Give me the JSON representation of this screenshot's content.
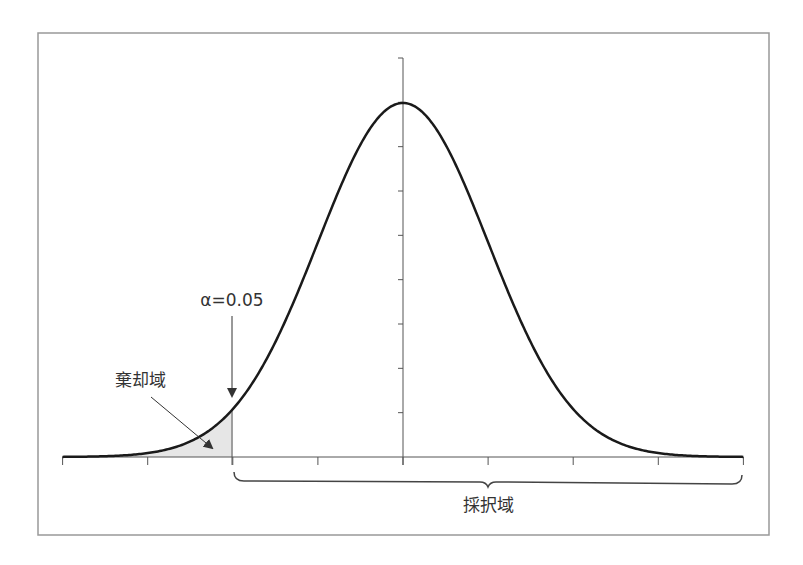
{
  "chart_data": {
    "type": "line",
    "title": "",
    "xlabel": "",
    "ylabel": "",
    "x_ticks_count": 9,
    "y_ticks_count": 9,
    "x_range_sigma": [
      -4,
      4
    ],
    "curve": "normal_pdf",
    "mean": 0,
    "sd": 1,
    "critical_value_z": -2,
    "shaded_region": {
      "from": -4,
      "to": -2,
      "color": "#e6e6e6"
    },
    "grid": false,
    "legend": null,
    "annotations": [
      {
        "text": "α=0.05",
        "target": "critical-value",
        "arrow": "down"
      },
      {
        "text": "棄却域",
        "target": "rejection-region",
        "arrow": "diagonal"
      },
      {
        "text": "採択域",
        "target": "acceptance-region",
        "brace": "under x-axis from critical value to right end"
      }
    ]
  },
  "labels": {
    "alpha": "α=0.05",
    "rejection_region": "棄却域",
    "acceptance_region": "採択域"
  },
  "colors": {
    "curve": "#1a1a1a",
    "axis": "#555555",
    "frame": "#999999",
    "shade": "#e6e6e6"
  }
}
